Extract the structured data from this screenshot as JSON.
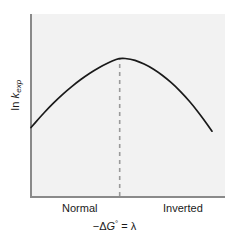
{
  "figure": {
    "background_color": "#ffffff",
    "panel_color": "#f2f2f2",
    "axis_color": "#8a8a8a",
    "curve_color": "#1a1a1a",
    "dashed_color": "#9a9a9a",
    "text_color": "#1a1a1a"
  },
  "labels": {
    "y_axis_prefix": "ln ",
    "y_axis_symbol": "k",
    "y_axis_subscript": "exp",
    "y_axis_full": "ln k_exp",
    "x_axis_full": "−ΔG° = λ",
    "x_axis_minus": "−Δ",
    "x_axis_symbol": "G",
    "x_axis_degree": "°",
    "x_axis_tail": " = λ",
    "region_left": "Normal",
    "region_right": "Inverted"
  },
  "chart_data": {
    "type": "line",
    "title": "",
    "subtitle": "",
    "xlabel": "−ΔG° = λ",
    "ylabel": "ln k_exp",
    "xlim": [
      0,
      1
    ],
    "ylim": [
      0,
      1
    ],
    "grid": false,
    "legend": null,
    "axis_ticks": {
      "x_tick_labels": [
        "Normal",
        "Inverted"
      ],
      "x_tick_positions": [
        0.2,
        0.78
      ],
      "y_tick_labels": [],
      "y_tick_positions": []
    },
    "series": [
      {
        "name": "Marcus parabola",
        "kind": "line",
        "style": "solid",
        "color": "#1a1a1a",
        "x": [
          0.0,
          0.05,
          0.1,
          0.15,
          0.2,
          0.25,
          0.3,
          0.35,
          0.4,
          0.45,
          0.49,
          0.55,
          0.6,
          0.65,
          0.7,
          0.75,
          0.8,
          0.85,
          0.9,
          0.95,
          1.0
        ],
        "y": [
          0.428,
          0.493,
          0.554,
          0.61,
          0.661,
          0.707,
          0.749,
          0.786,
          0.818,
          0.845,
          0.862,
          0.857,
          0.838,
          0.811,
          0.776,
          0.733,
          0.683,
          0.625,
          0.559,
          0.486,
          0.405
        ]
      }
    ],
    "annotations": [
      {
        "kind": "vertical-dashed-line",
        "name": "lambda-marker",
        "x": 0.49,
        "y_from": 0.0,
        "y_to": 0.862,
        "color": "#9a9a9a",
        "label": ""
      }
    ],
    "regions": [
      {
        "name": "Normal",
        "x_from": 0.0,
        "x_to": 0.49
      },
      {
        "name": "Inverted",
        "x_from": 0.49,
        "x_to": 1.0
      }
    ]
  }
}
